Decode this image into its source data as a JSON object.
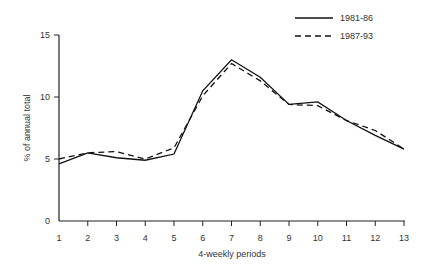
{
  "chart_data": {
    "type": "line",
    "title": "",
    "xlabel": "4-weekly periods",
    "ylabel": "% of annual total",
    "categories": [
      1,
      2,
      3,
      4,
      5,
      6,
      7,
      8,
      9,
      10,
      11,
      12,
      13
    ],
    "x": [
      1,
      2,
      3,
      4,
      5,
      6,
      7,
      8,
      9,
      10,
      11,
      12,
      13
    ],
    "series": [
      {
        "name": "1981-86",
        "style": "solid",
        "values": [
          4.6,
          5.5,
          5.1,
          4.9,
          5.4,
          10.5,
          13.0,
          11.6,
          9.4,
          9.6,
          8.1,
          6.9,
          5.8
        ]
      },
      {
        "name": "1987-93",
        "style": "dashed",
        "values": [
          5.0,
          5.5,
          5.6,
          5.0,
          5.9,
          10.1,
          12.7,
          11.3,
          9.4,
          9.3,
          8.1,
          7.3,
          5.8
        ]
      }
    ],
    "xlim": [
      1,
      13
    ],
    "ylim": [
      0,
      15
    ],
    "yticks": [
      0,
      5,
      10,
      15
    ],
    "xticks": [
      1,
      2,
      3,
      4,
      5,
      6,
      7,
      8,
      9,
      10,
      11,
      12,
      13
    ],
    "grid": false,
    "legend_position": "top-right"
  },
  "labels": {
    "xlabel": "4-weekly periods",
    "ylabel": "% of annual total",
    "legend": [
      "1981-86",
      "1987-93"
    ]
  }
}
